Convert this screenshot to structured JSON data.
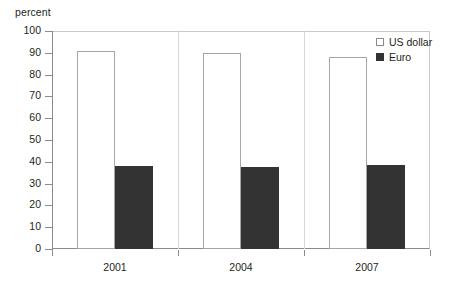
{
  "chart_data": {
    "type": "bar",
    "title": "",
    "xlabel": "",
    "ylabel": "percent",
    "categories": [
      "2001",
      "2004",
      "2007"
    ],
    "series": [
      {
        "name": "US dollar",
        "values": [
          91,
          90,
          88
        ],
        "color": "#ffffff",
        "swatch": "open"
      },
      {
        "name": "Euro",
        "values": [
          38,
          37.5,
          38.5
        ],
        "color": "#333333",
        "swatch": "filled"
      }
    ],
    "ylim": [
      0,
      100
    ],
    "yticks": [
      0,
      10,
      20,
      30,
      40,
      50,
      60,
      70,
      80,
      90,
      100
    ],
    "ytick_labels": [
      "0",
      "10",
      "20",
      "30",
      "40",
      "50",
      "60",
      "70",
      "80",
      "90",
      "100"
    ],
    "grid": false,
    "legend_position": "top-right"
  },
  "axis": {
    "y_title": "percent"
  },
  "legend": {
    "items": [
      {
        "label": "US dollar"
      },
      {
        "label": "Euro"
      }
    ]
  },
  "colors": {
    "usd_fill": "#ffffff",
    "usd_border": "#a6a6a6",
    "euro_fill": "#333333",
    "axis": "#8b8b8b",
    "text": "#231f20"
  }
}
